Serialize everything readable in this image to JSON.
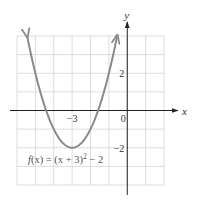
{
  "chart_data": {
    "type": "line",
    "title": "",
    "xlabel": "x",
    "ylabel": "y",
    "xlim": [
      -6,
      2
    ],
    "ylim": [
      -4,
      4
    ],
    "grid": true,
    "grid_step": 1,
    "x_ticks": [
      {
        "value": -3,
        "label": "−3"
      },
      {
        "value": 0,
        "label": "0"
      }
    ],
    "y_ticks": [
      {
        "value": 2,
        "label": "2"
      },
      {
        "value": -2,
        "label": "−2"
      }
    ],
    "series": [
      {
        "name": "f(x) = (x + 3)² − 2",
        "function": "(x+3)^2-2",
        "vertex": [
          -3,
          -2
        ],
        "x_intercepts": [
          -4.414,
          -1.586
        ],
        "color": "#8a8a8a",
        "arrows_both_ends": true
      }
    ],
    "annotations": [
      {
        "text_parts": {
          "f": "f",
          "lhs": "(x) = (x + 3)",
          "sup": "2",
          "rhs": " − 2"
        },
        "position": "below-vertex"
      }
    ]
  },
  "labels": {
    "x_axis": "x",
    "y_axis": "y",
    "func_f": "f",
    "func_mid": "(x) = (x + 3)",
    "func_sup": "2",
    "func_end": " − 2"
  }
}
